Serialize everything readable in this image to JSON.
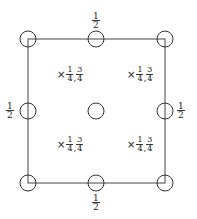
{
  "diagram": {
    "type": "symmetry-cell",
    "square": {
      "left": 28,
      "top": 39,
      "right": 165,
      "bottom": 183,
      "stroke": "#444444"
    },
    "circle_radius": 8,
    "circles": [
      {
        "name": "corner-top-left",
        "cx": 28,
        "cy": 39
      },
      {
        "name": "edge-top-mid",
        "cx": 96,
        "cy": 39
      },
      {
        "name": "corner-top-right",
        "cx": 165,
        "cy": 39
      },
      {
        "name": "edge-left-mid",
        "cx": 28,
        "cy": 111
      },
      {
        "name": "center",
        "cx": 96,
        "cy": 111
      },
      {
        "name": "edge-right-mid",
        "cx": 165,
        "cy": 111
      },
      {
        "name": "corner-bottom-left",
        "cx": 28,
        "cy": 183
      },
      {
        "name": "edge-bottom-mid",
        "cx": 96,
        "cy": 183
      },
      {
        "name": "corner-bottom-right",
        "cx": 165,
        "cy": 183
      }
    ],
    "edge_labels": {
      "top": {
        "num": "1",
        "den": "2"
      },
      "bottom": {
        "num": "1",
        "den": "2"
      },
      "left": {
        "num": "1",
        "den": "2"
      },
      "right": {
        "num": "1",
        "den": "2"
      }
    },
    "inner_marks": [
      {
        "symbol": "×",
        "a_num": "1",
        "a_den": "4",
        "sep": ",",
        "b_num": "3",
        "b_den": "4"
      },
      {
        "symbol": "×",
        "a_num": "1",
        "a_den": "4",
        "sep": ",",
        "b_num": "3",
        "b_den": "4"
      },
      {
        "symbol": "×",
        "a_num": "1",
        "a_den": "4",
        "sep": ",",
        "b_num": "3",
        "b_den": "4"
      },
      {
        "symbol": "×",
        "a_num": "1",
        "a_den": "4",
        "sep": ",",
        "b_num": "3",
        "b_den": "4"
      }
    ]
  }
}
